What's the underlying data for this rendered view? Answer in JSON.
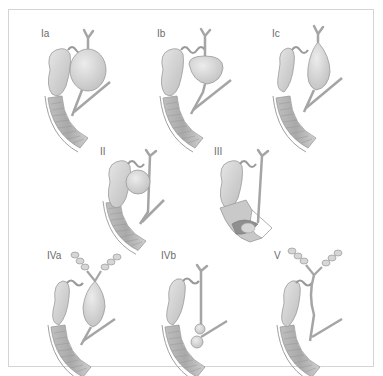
{
  "figure": {
    "colors": {
      "frame": "#d4d4d4",
      "label": "#6b6b6b",
      "organ_fill": "#d9d9d9",
      "organ_stroke": "#9a9a9a",
      "duodenum_fill": "#c4c4c4",
      "duodenum_stripe": "#a8a8a8"
    },
    "panels": [
      {
        "id": "Ia",
        "label": "Ia",
        "type": "cystic-dilation-large"
      },
      {
        "id": "Ib",
        "label": "Ib",
        "type": "focal-segmental-dilation"
      },
      {
        "id": "Ic",
        "label": "Ic",
        "type": "fusiform-dilation"
      },
      {
        "id": "II",
        "label": "II",
        "type": "diverticulum"
      },
      {
        "id": "III",
        "label": "III",
        "type": "choledochocele"
      },
      {
        "id": "IVa",
        "label": "IVa",
        "type": "intra-and-extrahepatic-cysts"
      },
      {
        "id": "IVb",
        "label": "IVb",
        "type": "multiple-extrahepatic-cysts"
      },
      {
        "id": "V",
        "label": "V",
        "type": "intrahepatic-cysts-caroli"
      }
    ]
  }
}
